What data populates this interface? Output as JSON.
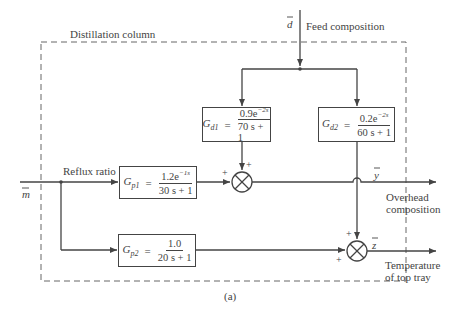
{
  "diagram": {
    "boundary_label": "Distillation column",
    "caption": "(a)",
    "inputs": {
      "disturbance": {
        "symbol": "d",
        "label": "Feed composition"
      },
      "manipulated": {
        "symbol": "m",
        "label": "Reflux ratio"
      }
    },
    "outputs": {
      "y": {
        "symbol": "y",
        "label_line1": "Overhead",
        "label_line2": "composition"
      },
      "z": {
        "symbol": "z",
        "label_line1": "Temperature",
        "label_line2": "of top tray"
      }
    },
    "blocks": {
      "gd1": {
        "name": "G",
        "sub": "d1",
        "eq": "=",
        "num_coef": "0.9e",
        "num_exp": "−2s",
        "den": "70 s + 1"
      },
      "gd2": {
        "name": "G",
        "sub": "d2",
        "eq": "=",
        "num_coef": "0.2e",
        "num_exp": "−2s",
        "den": "60 s + 1"
      },
      "gp1": {
        "name": "G",
        "sub": "p1",
        "eq": "=",
        "num_coef": "1.2e",
        "num_exp": "−1s",
        "den": "30 s + 1"
      },
      "gp2": {
        "name": "G",
        "sub": "p2",
        "eq": "=",
        "num_coef": "1.0",
        "num_exp": "",
        "den": "20 s + 1"
      }
    },
    "summing_junctions": {
      "sum1": {
        "sign_top": "+",
        "sign_left": "+"
      },
      "sum2": {
        "sign_top": "+",
        "sign_left": "+"
      }
    },
    "colors": {
      "line": "#444444",
      "boundary": "#666666",
      "background": "#ffffff"
    }
  }
}
